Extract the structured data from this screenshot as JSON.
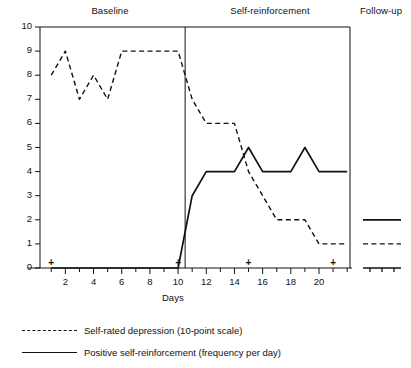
{
  "chart_data": {
    "type": "line",
    "title": "",
    "xlabel": "Days",
    "ylabel": "",
    "xlim": [
      0.2,
      22.2
    ],
    "ylim": [
      0,
      10
    ],
    "x_ticks_major": [
      2,
      4,
      6,
      8,
      10,
      12,
      14,
      16,
      18,
      20
    ],
    "x_ticks_minor": [
      1,
      3,
      5,
      7,
      9,
      11,
      13,
      15,
      17,
      19,
      21,
      22
    ],
    "y_ticks": [
      0,
      1,
      2,
      3,
      4,
      5,
      6,
      7,
      8,
      9,
      10
    ],
    "grid": false,
    "legend_position": "below",
    "x": [
      1,
      2,
      3,
      4,
      5,
      6,
      7,
      8,
      9,
      10,
      11,
      12,
      13,
      14,
      15,
      16,
      17,
      18,
      19,
      20,
      21,
      22
    ],
    "series": [
      {
        "name": "Self-rated depression (10-point scale)",
        "style": "dashed",
        "values": [
          8,
          9,
          7,
          8,
          7,
          9,
          9,
          9,
          9,
          9,
          7,
          6,
          6,
          6,
          4,
          3,
          2,
          2,
          2,
          1,
          1,
          1
        ]
      },
      {
        "name": "Positive self-reinforcement (frequency per day)",
        "style": "solid",
        "values": [
          0,
          0,
          0,
          0,
          0,
          0,
          0,
          0,
          0,
          0,
          3,
          4,
          4,
          4,
          5,
          4,
          4,
          4,
          5,
          4,
          4,
          4
        ]
      }
    ],
    "phases": [
      {
        "label": "Baseline",
        "x_start": 0.2,
        "x_end": 10.5
      },
      {
        "label": "Self-reinforcement",
        "x_start": 10.5,
        "x_end": 22.2
      },
      {
        "label": "Follow-up",
        "x_start": 22.2,
        "x_end": 24.6
      }
    ],
    "event_markers": {
      "symbol": "+",
      "days": [
        1,
        10,
        15,
        21
      ]
    },
    "followup_panel": {
      "depression_value": 1,
      "reinforcement_value": 2,
      "tick_count": 3
    }
  },
  "legend": {
    "items": [
      {
        "label": "Self-rated depression (10-point scale)",
        "style": "dashed"
      },
      {
        "label": "Positive self-reinforcement (frequency per day)",
        "style": "solid"
      }
    ]
  }
}
